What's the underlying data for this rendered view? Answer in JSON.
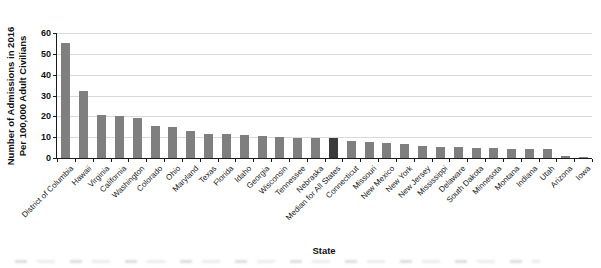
{
  "chart_data": {
    "type": "bar",
    "title": "",
    "xlabel": "State",
    "ylabel_lines": [
      "Number of Admissions in 2016",
      "Per 100,000 Adult Civilians"
    ],
    "ylim": [
      0,
      60
    ],
    "yticks": [
      0,
      10,
      20,
      30,
      40,
      50,
      60
    ],
    "grid": true,
    "legend": "none",
    "categories": [
      "District of Columbia",
      "Hawaii",
      "Virginia",
      "California",
      "Washington",
      "Colorado",
      "Ohio",
      "Maryland",
      "Texas",
      "Florida",
      "Idaho",
      "Georgia",
      "Wisconsin",
      "Tennessee",
      "Nebraska",
      "Median for All States",
      "Connecticut",
      "Missouri",
      "New Mexico",
      "New York",
      "New Jersey",
      "Mississippi",
      "Delaware",
      "South Dakota",
      "Minnesota",
      "Montana",
      "Indiana",
      "Utah",
      "Arizona",
      "Iowa"
    ],
    "values": [
      55,
      32,
      20.5,
      20,
      19,
      15.5,
      15,
      13,
      11.5,
      11.5,
      11,
      10.5,
      10,
      9.5,
      9.5,
      9.5,
      8,
      7.5,
      7,
      6.5,
      6,
      5.5,
      5.5,
      5,
      5,
      4.5,
      4.5,
      4.5,
      1,
      0.5
    ],
    "highlight_index": 15,
    "highlight_label": "Median for All States",
    "colors": {
      "bar": "#7f7f7f",
      "highlight": "#3b3b3b",
      "gridline": "#d9d9d9",
      "axis": "#1a1a1a",
      "text": "#1a1a1a"
    }
  }
}
